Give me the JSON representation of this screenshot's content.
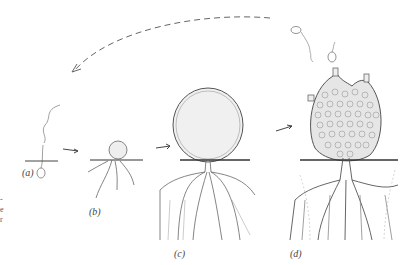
{
  "figure": {
    "stages": [
      {
        "id": "a",
        "label": "(a)",
        "description": "zoospore settling on substrate"
      },
      {
        "id": "b",
        "label": "(b)",
        "description": "young thallus with rhizoids"
      },
      {
        "id": "c",
        "label": "(c)",
        "description": "enlarged sporangium with branched rhizoids"
      },
      {
        "id": "d",
        "label": "(d)",
        "description": "mature sporangium releasing zoospores"
      }
    ],
    "edge_text": [
      "-",
      "e",
      "r"
    ],
    "colors": {
      "line": "#555555",
      "fill": "#e8e8e8",
      "background": "#ffffff"
    }
  }
}
